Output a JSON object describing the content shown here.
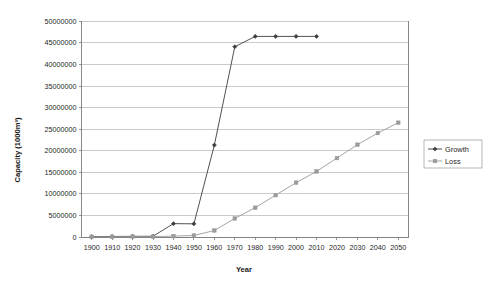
{
  "chart_data": {
    "type": "line",
    "title": "",
    "xlabel": "Year",
    "ylabel": "Capacity (1000m³)",
    "xlim": [
      1895,
      2055
    ],
    "ylim": [
      0,
      50000000
    ],
    "grid": true,
    "legend_position": "right",
    "x": [
      1900,
      1910,
      1920,
      1930,
      1940,
      1950,
      1960,
      1970,
      1980,
      1990,
      2000,
      2010,
      2020,
      2030,
      2040,
      2050
    ],
    "xticks": [
      "1900",
      "1910",
      "1920",
      "1930",
      "1940",
      "1950",
      "1960",
      "1970",
      "1980",
      "1990",
      "2000",
      "2010",
      "2020",
      "2030",
      "2040",
      "2050"
    ],
    "yticks": [
      "0",
      "5000000",
      "10000000",
      "15000000",
      "20000000",
      "25000000",
      "30000000",
      "35000000",
      "40000000",
      "45000000",
      "50000000"
    ],
    "ytick_values": [
      0,
      5000000,
      10000000,
      15000000,
      20000000,
      25000000,
      30000000,
      35000000,
      40000000,
      45000000,
      50000000
    ],
    "series": [
      {
        "name": "Growth",
        "marker": "diamond",
        "color": "#3d3d3d",
        "x": [
          1900,
          1910,
          1920,
          1930,
          1940,
          1950,
          1960,
          1970,
          1980,
          1990,
          2000,
          2010
        ],
        "values": [
          100000,
          120000,
          150000,
          180000,
          3100000,
          3050000,
          21300000,
          44100000,
          46500000,
          46500000,
          46500000,
          46500000
        ]
      },
      {
        "name": "Loss",
        "marker": "square",
        "color": "#9a9a9a",
        "x": [
          1900,
          1910,
          1920,
          1930,
          1940,
          1950,
          1960,
          1970,
          1980,
          1990,
          2000,
          2010,
          2020,
          2030,
          2040,
          2050
        ],
        "values": [
          50000,
          60000,
          80000,
          100000,
          200000,
          350000,
          1500000,
          4300000,
          6800000,
          9700000,
          12600000,
          15200000,
          18300000,
          21400000,
          24100000,
          26500000
        ]
      }
    ]
  },
  "legend": {
    "entries": [
      {
        "label": "Growth"
      },
      {
        "label": "Loss"
      }
    ]
  },
  "axes": {
    "x_title": "Year",
    "y_title": "Capacity (1000m³)"
  }
}
